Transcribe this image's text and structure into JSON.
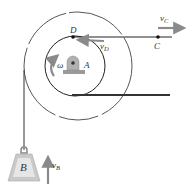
{
  "diagram": {
    "labels": {
      "D": "D",
      "A": "A",
      "C": "C",
      "B": "B",
      "omega": "ω",
      "vC_main": "v",
      "vC_sub": "C",
      "vD_main": "v",
      "vD_sub": "D",
      "vB_main": "v",
      "vB_sub": "B"
    },
    "colors": {
      "line": "#2a2a2a",
      "circle": "#444444",
      "arrow": "#8a8a8a",
      "weight_fill": "#c9c9c9",
      "weight_inner": "#e6e6e6",
      "bearing": "#9a9a9a",
      "label": "#333333"
    }
  }
}
